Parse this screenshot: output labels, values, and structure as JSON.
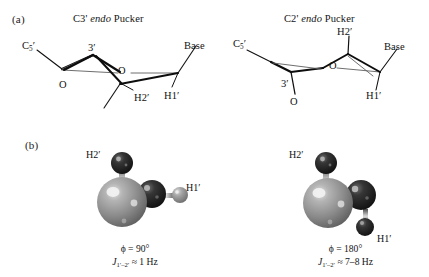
{
  "figure": {
    "panels": [
      {
        "tag": "(a)",
        "subpanels": [
          {
            "title_prefix": "C3'",
            "title_italic": "endo",
            "title_suffix": "Pucker",
            "labels": {
              "c5": "C",
              "c5_sub": "5",
              "c5_prime": "′",
              "ring_carbon": "3′",
              "ring_oxygen": "O",
              "hydroxyl_oxygen": "O",
              "base": "Base",
              "h2": "H2′",
              "h1": "H1′"
            }
          },
          {
            "title_prefix": "C2'",
            "title_italic": "endo",
            "title_suffix": "Pucker",
            "labels": {
              "c5": "C",
              "c5_sub": "5",
              "c5_prime": "′",
              "ring_carbon": "3′",
              "ring_oxygen": "O",
              "hydroxyl_oxygen": "O",
              "base": "Base",
              "h2": "H2′",
              "h1": "H1′"
            }
          }
        ]
      },
      {
        "tag": "(b)",
        "models": [
          {
            "h2_label": "H2′",
            "h1_label": "H1′",
            "caption_phi": "ϕ = 90°",
            "caption_j_symbol": "J",
            "caption_j_sub": "1′–2′",
            "caption_j_value": " ≈ 1 Hz"
          },
          {
            "h2_label": "H2′",
            "h1_label": "H1′",
            "caption_phi": "ϕ = 180°",
            "caption_j_symbol": "J",
            "caption_j_sub": "1′–2′",
            "caption_j_value": " ≈ 7–8 Hz"
          }
        ]
      }
    ],
    "colors": {
      "background": "#ffffff",
      "line": "#111111",
      "thin_line": "#5d5d5d",
      "carbon_large_sphere": "#8c8c8c",
      "carbon_dark_sphere": "#1e1e1e",
      "hydrogen_sphere": "#9a9a9a",
      "text": "#121212"
    }
  }
}
